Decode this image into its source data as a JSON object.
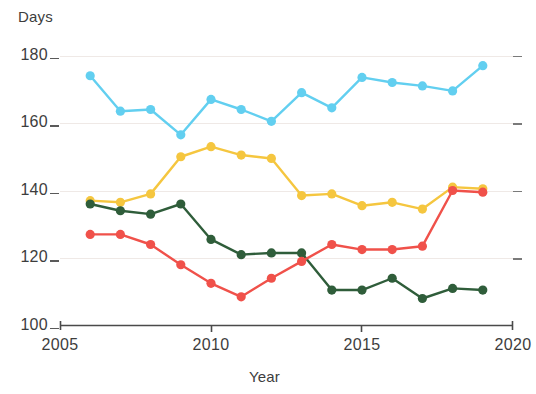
{
  "chart_data": {
    "type": "line",
    "title": "",
    "xlabel": "Year",
    "ylabel": "Days",
    "xlim": [
      2005,
      2020
    ],
    "ylim": [
      100,
      180
    ],
    "x_ticks": [
      2005,
      2010,
      2015,
      2020
    ],
    "y_ticks": [
      100,
      120,
      140,
      160,
      180
    ],
    "grid": true,
    "legend_position": "none",
    "x": [
      2006,
      2007,
      2008,
      2009,
      2010,
      2011,
      2012,
      2013,
      2014,
      2015,
      2016,
      2017,
      2018,
      2019
    ],
    "series": [
      {
        "name": "light-blue-series",
        "color": "#62CFF0",
        "values": [
          174,
          163.5,
          164,
          156.5,
          167,
          164,
          160.5,
          169,
          164.5,
          173.5,
          172,
          171,
          169.5,
          177
        ]
      },
      {
        "name": "yellow-series",
        "color": "#F5C63F",
        "values": [
          137,
          136.5,
          139,
          150,
          153,
          150.5,
          149.5,
          138.5,
          139,
          135.5,
          136.5,
          134.5,
          141,
          140.5
        ]
      },
      {
        "name": "dark-green-series",
        "color": "#2F5D3A",
        "values": [
          136,
          134,
          133,
          136,
          125.5,
          121,
          121.5,
          121.5,
          110.5,
          110.5,
          114,
          108,
          111,
          110.5
        ]
      },
      {
        "name": "red-series",
        "color": "#F0514A",
        "values": [
          127,
          127,
          124,
          118,
          112.5,
          108.5,
          114,
          119,
          124,
          122.5,
          122.5,
          123.5,
          140,
          139.5
        ]
      }
    ]
  },
  "axis": {
    "y_title": "Days",
    "x_title": "Year",
    "y_tick_labels": [
      "180",
      "160",
      "140",
      "120",
      "100"
    ],
    "x_tick_labels": [
      "2005",
      "2010",
      "2015",
      "2020"
    ]
  }
}
